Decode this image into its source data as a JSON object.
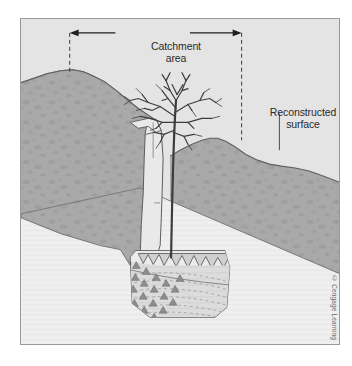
{
  "figure": {
    "type": "geological-cross-section",
    "background_color": "#e4e4e4",
    "frame_border_color": "#9a9a9a"
  },
  "labels": {
    "catchment": "Catchment\narea",
    "reconstructed": "Reconstructed\nsurface"
  },
  "credit": {
    "text": "© Cengage Learning"
  },
  "caption": {
    "text": ""
  },
  "colors": {
    "sky": "#e4e4e4",
    "bedrock_upper": "#a8a8a8",
    "bedrock_mottle": "#9c9c9c",
    "bedrock_lower": "#efefef",
    "fissure_fill": "#e8e8e8",
    "deposit_fill": "#d6d6d6",
    "deposit_fill_light": "#e6e6e6",
    "outline": "#555555",
    "dash_line": "#3a3a3a",
    "tree": "#3c3c3c",
    "text": "#2b2b2b"
  },
  "annotations": {
    "catchment_arrow": {
      "left_x": 69,
      "right_x": 242,
      "y": 31,
      "style": "double-headed-arrow-with-dashed-droplines"
    },
    "reconstructed_leader": {
      "x": 280,
      "y_top": 112,
      "y_bottom": 138
    }
  },
  "scene_elements": [
    {
      "name": "sky-background",
      "desc": "light gray sky filling upper area"
    },
    {
      "name": "left-hill",
      "desc": "mottled gray limestone hill on left with rounded crest"
    },
    {
      "name": "right-hill",
      "desc": "mottled gray limestone hill on right, crest lower than left"
    },
    {
      "name": "lower-bedrock",
      "desc": "pale lower rock unit with faint horizontal lamination, separated by diagonal contact"
    },
    {
      "name": "vertical-fissure",
      "desc": "narrow solution shaft descending from surface to cave"
    },
    {
      "name": "cave-deposit",
      "desc": "sediment-filled cave chamber at base of fissure"
    },
    {
      "name": "cave-ceiling-scallops",
      "desc": "jagged scalloped ceiling / stalactite fringe"
    },
    {
      "name": "breccia-clasts",
      "desc": "triangular angular clast symbols on left side of deposit"
    },
    {
      "name": "laminated-fill",
      "desc": "curved dashed lamination lines on right side of deposit"
    },
    {
      "name": "tree",
      "desc": "bare deciduous tree growing at the fissure mouth"
    }
  ]
}
